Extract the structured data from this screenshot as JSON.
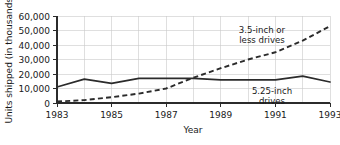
{
  "chart_data": {
    "type": "line",
    "title": "",
    "xlabel": "Year",
    "ylabel": "Units shipped (in thousands)",
    "x": [
      1983,
      1984,
      1985,
      1986,
      1987,
      1988,
      1989,
      1990,
      1991,
      1992,
      1993
    ],
    "xlim": [
      1983,
      1993
    ],
    "ylim": [
      0,
      60000
    ],
    "xticks": [
      1983,
      1985,
      1987,
      1989,
      1991,
      1993
    ],
    "xtick_labels": [
      "1983",
      "1985",
      "1987",
      "1989",
      "1991",
      "1993"
    ],
    "yticks": [
      0,
      10000,
      20000,
      30000,
      40000,
      50000,
      60000
    ],
    "ytick_labels": [
      "0",
      "10,000",
      "20,000",
      "30,000",
      "40,000",
      "50,000",
      "60,000"
    ],
    "grid": "vertical and horizontal",
    "legend_position": "inline annotations",
    "series": [
      {
        "name": "5.25-inch drives",
        "style": "solid",
        "color": "#2b2b2b",
        "values": [
          11000,
          16500,
          13500,
          17000,
          17000,
          17000,
          16000,
          16000,
          16000,
          18500,
          14500
        ],
        "annotation": "5.25-inch\ndrives",
        "annotation_line1": "5.25-inch",
        "annotation_line2": "drives"
      },
      {
        "name": "3.5-inch or less drives",
        "style": "dashed",
        "color": "#2b2b2b",
        "values": [
          1000,
          2000,
          4000,
          6500,
          10000,
          17500,
          24000,
          30000,
          35000,
          43000,
          53000
        ],
        "annotation": "3.5-inch or\nless drives",
        "annotation_line1": "3.5-inch or",
        "annotation_line2": "less drives"
      }
    ]
  },
  "colors": {
    "background": "#ffffff",
    "axis": "#2b2b2b",
    "grid": "#c9c9c9",
    "text": "#1a1a1a"
  }
}
